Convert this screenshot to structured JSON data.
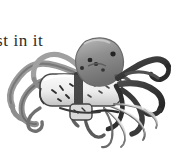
{
  "page": {
    "width_px": 176,
    "height_px": 155,
    "background_color": "#ffffff",
    "media_type": "grayscale-illustration"
  },
  "caption": {
    "visible_text": "st in it",
    "clipped_at_left_edge": true,
    "text_color": "#2b2b2b"
  },
  "illustration": {
    "title": "octopus grasping a cylindrical object",
    "palette": {
      "ink_dark": "#2a2a2a",
      "ink_mid": "#6f6f6f",
      "ink_light": "#a9a9a9",
      "wash_pale": "#d7d7d7",
      "highlight": "#f4f4f4",
      "paper": "#ffffff"
    },
    "parts": [
      {
        "name": "mantle",
        "label": "octopus head and mantle",
        "tone": "#8e8e8e"
      },
      {
        "name": "eyes",
        "label": "eye spots",
        "tone": "#2a2a2a",
        "count": 2
      },
      {
        "name": "mantle-speckles",
        "label": "dark speckles on mantle",
        "tone": "#333333"
      },
      {
        "name": "cylinder",
        "label": "light cylindrical object held by arms",
        "tone": "#efefef"
      },
      {
        "name": "cylinder-band",
        "label": "dark band across cylinder",
        "tone": "#3a3a3a"
      },
      {
        "name": "arms-left",
        "label": "long curling left arms",
        "tone": "#8a8a8a"
      },
      {
        "name": "arms-right",
        "label": "dark curling right arms",
        "tone": "#3d3d3d"
      },
      {
        "name": "arms-lower",
        "label": "pale fanning lower arms",
        "tone": "#c9c9c9"
      }
    ]
  }
}
